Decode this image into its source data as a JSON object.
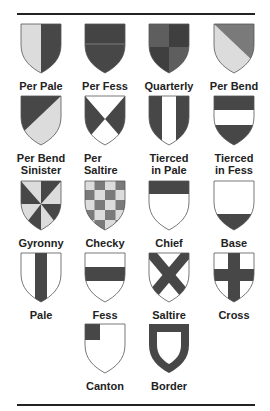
{
  "colors": {
    "dark": "#474747",
    "medium": "#7a7a7a",
    "light": "#dcdcdc",
    "white": "#ffffff",
    "outline": "#555555",
    "text": "#222222"
  },
  "shields": [
    {
      "id": "per-pale",
      "label": "Per Pale",
      "label2": ""
    },
    {
      "id": "per-fess",
      "label": "Per Fess",
      "label2": ""
    },
    {
      "id": "quarterly",
      "label": "Quarterly",
      "label2": ""
    },
    {
      "id": "per-bend",
      "label": "Per Bend",
      "label2": ""
    },
    {
      "id": "per-bend-sinister",
      "label": "Per Bend",
      "label2": "Sinister"
    },
    {
      "id": "per-saltire",
      "label": "Per",
      "label2": "Saltire"
    },
    {
      "id": "tierced-in-pale",
      "label": "Tierced",
      "label2": "in Pale"
    },
    {
      "id": "tierced-in-fess",
      "label": "Tierced",
      "label2": "in Fess"
    },
    {
      "id": "gyronny",
      "label": "Gyronny",
      "label2": ""
    },
    {
      "id": "checky",
      "label": "Checky",
      "label2": ""
    },
    {
      "id": "chief",
      "label": "Chief",
      "label2": ""
    },
    {
      "id": "base",
      "label": "Base",
      "label2": ""
    },
    {
      "id": "pale",
      "label": "Pale",
      "label2": ""
    },
    {
      "id": "fess",
      "label": "Fess",
      "label2": ""
    },
    {
      "id": "saltire",
      "label": "Saltire",
      "label2": ""
    },
    {
      "id": "cross",
      "label": "Cross",
      "label2": ""
    },
    {
      "id": "canton",
      "label": "Canton",
      "label2": ""
    },
    {
      "id": "border",
      "label": "Border",
      "label2": ""
    }
  ]
}
